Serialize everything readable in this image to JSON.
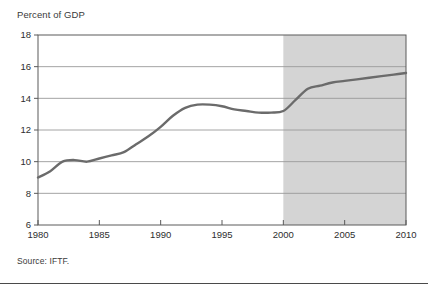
{
  "figure": {
    "axis_title": "Percent of GDP",
    "source_note": "Source: IFTF."
  },
  "colors": {
    "line": "#6b6b6b",
    "forecast_shading": "#d4d4d4",
    "gridline": "#9a9a9a",
    "axis": "#5a5a5a",
    "text": "#2e2e2e"
  },
  "chart_data": {
    "type": "line",
    "title": "",
    "xlabel": "",
    "ylabel": "Percent of GDP",
    "xlim": [
      1980,
      2010
    ],
    "ylim": [
      6,
      18
    ],
    "yticks": [
      6,
      8,
      10,
      12,
      14,
      16,
      18
    ],
    "xticks": [
      1980,
      1985,
      1990,
      1995,
      2000,
      2005,
      2010
    ],
    "ytick_labels": [
      "6",
      "8",
      "10",
      "12",
      "14",
      "16",
      "18"
    ],
    "xtick_labels": [
      "1980",
      "1985",
      "1990",
      "1995",
      "2000",
      "2005",
      "2010"
    ],
    "grid": true,
    "legend": "none",
    "annotations": [
      {
        "type": "shaded-span",
        "label": "forecast",
        "x_start": 2000,
        "x_end": 2010
      }
    ],
    "series": [
      {
        "name": "Health care spending",
        "x": [
          1980,
          1981,
          1982,
          1983,
          1984,
          1985,
          1986,
          1987,
          1988,
          1989,
          1990,
          1991,
          1992,
          1993,
          1994,
          1995,
          1996,
          1997,
          1998,
          1999,
          2000,
          2001,
          2002,
          2003,
          2004,
          2005,
          2006,
          2007,
          2008,
          2009,
          2010
        ],
        "values": [
          9.0,
          9.4,
          10.0,
          10.1,
          10.0,
          10.2,
          10.4,
          10.6,
          11.1,
          11.6,
          12.2,
          12.9,
          13.4,
          13.6,
          13.6,
          13.5,
          13.3,
          13.2,
          13.1,
          13.1,
          13.2,
          13.9,
          14.6,
          14.8,
          15.0,
          15.1,
          15.2,
          15.3,
          15.4,
          15.5,
          15.6
        ]
      }
    ]
  }
}
